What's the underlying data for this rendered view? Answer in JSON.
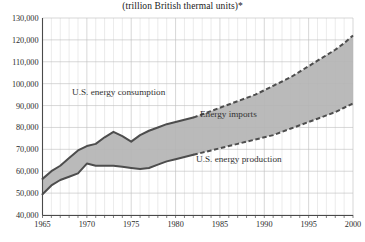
{
  "chart_data": {
    "type": "area",
    "title": "(trillion British thermal units)*",
    "xlabel": "",
    "ylabel": "",
    "xlim": [
      1965,
      2000
    ],
    "ylim": [
      40000,
      130000
    ],
    "grid": true,
    "legend_position": "inline-annotations",
    "x_ticks": [
      "1965",
      "1970",
      "1975",
      "1980",
      "1985",
      "1990",
      "1995",
      "2000"
    ],
    "y_ticks": [
      "40,000",
      "50,000",
      "60,000",
      "70,000",
      "80,000",
      "90,000",
      "100,000",
      "110,000",
      "120,000",
      "130,000"
    ],
    "annotations": [
      {
        "name": "consumption-label",
        "text": "U.S. energy consumption"
      },
      {
        "name": "imports-label",
        "text": "Energy imports"
      },
      {
        "name": "production-label",
        "text": "U.S. energy production"
      }
    ],
    "x": [
      1965,
      1966,
      1967,
      1968,
      1969,
      1970,
      1971,
      1972,
      1973,
      1974,
      1975,
      1976,
      1977,
      1978,
      1979,
      1980,
      1981,
      1982,
      1983,
      1984,
      1985,
      1986,
      1987,
      1988,
      1989,
      1990,
      1991,
      1992,
      1993,
      1994,
      1995,
      1996,
      1997,
      1998,
      1999,
      2000
    ],
    "projection_start_year": 1982,
    "series": [
      {
        "name": "U.S. energy consumption",
        "values": [
          56500,
          60000,
          62500,
          66000,
          69500,
          71500,
          72500,
          75500,
          78000,
          76000,
          73500,
          76500,
          78500,
          80000,
          81500,
          82500,
          83500,
          84500,
          86000,
          87500,
          89000,
          90500,
          92000,
          93500,
          95000,
          97000,
          99000,
          101000,
          103000,
          105500,
          108000,
          110500,
          113000,
          115500,
          118500,
          122000
        ]
      },
      {
        "name": "U.S. energy production",
        "values": [
          49500,
          53500,
          56000,
          57500,
          59000,
          63500,
          62500,
          62500,
          62500,
          62000,
          61500,
          61000,
          61500,
          63000,
          64500,
          65500,
          66500,
          67500,
          68500,
          69500,
          70500,
          71500,
          72500,
          73500,
          74500,
          75500,
          76500,
          78000,
          79500,
          81000,
          82500,
          84000,
          85500,
          87000,
          89000,
          91000
        ]
      }
    ],
    "band": {
      "name": "Energy imports",
      "description": "Shaded region between U.S. energy consumption and U.S. energy production",
      "fill_color": "#b4b4b4"
    }
  }
}
